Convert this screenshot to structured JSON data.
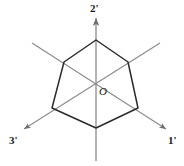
{
  "figure": {
    "type": "geometric-diagram",
    "colors": {
      "background": "#ffffff",
      "axis_line": "#8a8a8a",
      "shape_outline": "#2b2b2b",
      "label_text": "#1a1a1a"
    },
    "origin": {
      "label": "O",
      "x": 96,
      "y": 85
    },
    "axes": [
      {
        "id": "axis-1prime",
        "label": "1'",
        "direction": "lower-right",
        "arrow": true,
        "from": [
          32,
          43
        ],
        "to": [
          166,
          129
        ]
      },
      {
        "id": "axis-2prime",
        "label": "2'",
        "direction": "up",
        "arrow": true,
        "from": [
          96,
          160
        ],
        "to": [
          96,
          18
        ]
      },
      {
        "id": "axis-3prime",
        "label": "3'",
        "direction": "lower-left",
        "arrow": true,
        "from": [
          160,
          43
        ],
        "to": [
          24,
          129
        ]
      }
    ],
    "hexagon": {
      "label": "hexagon-outline",
      "vertices": [
        [
          96,
          40
        ],
        [
          128,
          62
        ],
        [
          138,
          108
        ],
        [
          96,
          128
        ],
        [
          52,
          108
        ],
        [
          64,
          62
        ]
      ]
    }
  }
}
